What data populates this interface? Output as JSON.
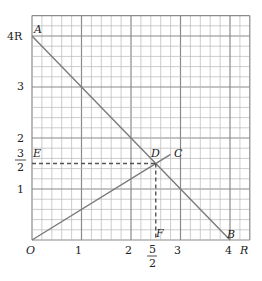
{
  "diagram": {
    "grid": {
      "x_max": 4.4,
      "y_max": 4.4,
      "minor_step": 0.2,
      "major_step": 1
    },
    "x_ticks": [
      {
        "value": 1,
        "label": "1"
      },
      {
        "value": 2,
        "label": "2"
      },
      {
        "value": 3,
        "label": "3"
      },
      {
        "value": 4,
        "label": "4"
      }
    ],
    "x_fraction_tick": {
      "value": 2.5,
      "num": "5",
      "den": "2"
    },
    "x_unit": "R",
    "y_ticks": [
      {
        "value": 1,
        "label": "1"
      },
      {
        "value": 2,
        "label": "2"
      },
      {
        "value": 3,
        "label": "3"
      },
      {
        "value": 4,
        "label": "4R"
      }
    ],
    "y_fraction_tick": {
      "value": 1.5,
      "num": "3",
      "den": "2"
    },
    "points": {
      "O": {
        "label": "O",
        "x": 0,
        "y": 0
      },
      "A": {
        "label": "A",
        "x": 0,
        "y": 4
      },
      "B": {
        "label": "B",
        "x": 4,
        "y": 0
      },
      "C": {
        "label": "C",
        "x": 2.8,
        "y": 1.68
      },
      "D": {
        "label": "D",
        "x": 2.5,
        "y": 1.5
      },
      "E": {
        "label": "E",
        "x": 0,
        "y": 1.5
      },
      "F": {
        "label": "F",
        "x": 2.5,
        "y": 0
      }
    },
    "lines": [
      {
        "name": "AB",
        "from": "A",
        "to": "B",
        "style": "solid"
      },
      {
        "name": "OC",
        "from": "O",
        "to": "C",
        "style": "solid"
      },
      {
        "name": "ED",
        "from": "E",
        "to": "D",
        "style": "dashed"
      },
      {
        "name": "DF",
        "from": "D",
        "to": "F",
        "style": "dashed"
      }
    ],
    "colors": {
      "grid_minor": "#b8b8b8",
      "grid_major": "#8a8a8a",
      "line": "#7a7a7a",
      "text": "#222222"
    }
  }
}
